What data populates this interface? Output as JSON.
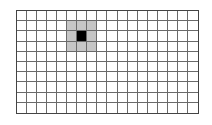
{
  "grid": {
    "columns": 18,
    "rows": 10,
    "selected_cell": {
      "col": 6,
      "row": 2
    },
    "highlight_region": {
      "col_start": 5,
      "col_end": 7,
      "row_start": 1,
      "row_end": 3
    },
    "colors": {
      "background": "#ffffff",
      "grid_line": "#6a6a6a",
      "border": "#444444",
      "highlight": "#c6c6c6",
      "selected": "#000000"
    }
  }
}
